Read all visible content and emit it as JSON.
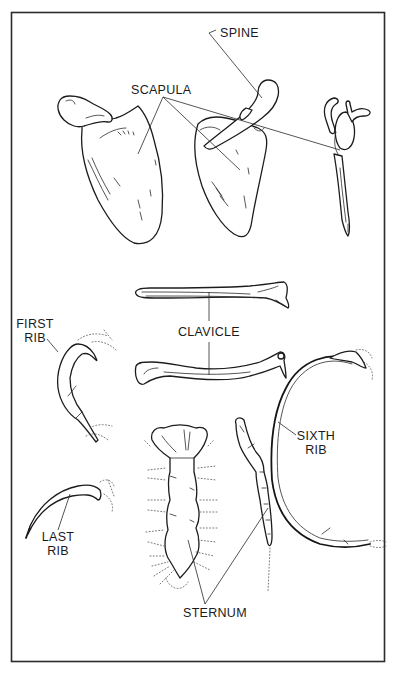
{
  "figure": {
    "frame": {
      "stroke_color": "#2b2b2b",
      "background": "#ffffff"
    },
    "labels": {
      "spine": "SPINE",
      "scapula": "SCAPULA",
      "clavicle": "CLAVICLE",
      "first_rib": {
        "line1": "FIRST",
        "line2": "RIB"
      },
      "sixth_rib": {
        "line1": "SIXTH",
        "line2": "RIB"
      },
      "last_rib": {
        "line1": "LAST",
        "line2": "RIB"
      },
      "sternum": "STERNUM"
    },
    "bones": [
      {
        "name": "scapula",
        "views": 3
      },
      {
        "name": "clavicle",
        "views": 2
      },
      {
        "name": "first-rib",
        "views": 1
      },
      {
        "name": "sixth-rib",
        "views": 1
      },
      {
        "name": "last-rib",
        "views": 1
      },
      {
        "name": "sternum",
        "views": 2
      }
    ]
  }
}
